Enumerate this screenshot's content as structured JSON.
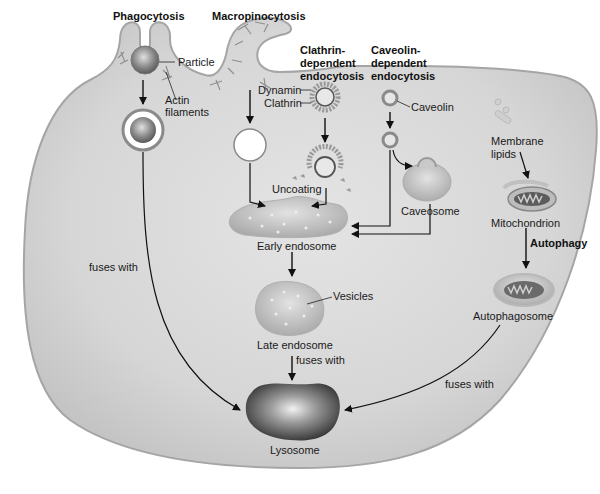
{
  "diagram": {
    "type": "endocytosis pathways in a cell",
    "colors": {
      "cytoplasm": "#d2d2d2",
      "membrane": "#a9a9a9",
      "organelle": "#bdbdbd",
      "arrow": "#111111",
      "lysosome": "#4a4a4a"
    }
  },
  "headings": {
    "phagocytosis": "Phagocytosis",
    "macropinocytosis": "Macropinocytosis",
    "clathrin_line1": "Clathrin-",
    "clathrin_line2": "dependent",
    "clathrin_line3": "endocytosis",
    "caveolin_line1": "Caveolin-",
    "caveolin_line2": "dependent",
    "caveolin_line3": "endocytosis",
    "autophagy": "Autophagy"
  },
  "labels": {
    "particle": "Particle",
    "actin_line1": "Actin",
    "actin_line2": "filaments",
    "dynamin": "Dynamin",
    "clathrin": "Clathrin",
    "caveolin": "Caveolin",
    "uncoating": "Uncoating",
    "caveosome": "Caveosome",
    "early_endosome": "Early endosome",
    "vesicles": "Vesicles",
    "late_endosome": "Late endosome",
    "fuses_with_left": "fuses with",
    "fuses_with_center": "fuses with",
    "fuses_with_right": "fuses with",
    "lysosome": "Lysosome",
    "membrane_lipids_line1": "Membrane",
    "membrane_lipids_line2": "lipids",
    "mitochondrion": "Mitochondrion",
    "autophagosome": "Autophagosome"
  }
}
